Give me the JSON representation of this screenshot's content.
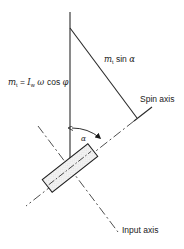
{
  "diagram": {
    "type": "gyroscope-vector-diagram",
    "labels": {
      "torque_equation": {
        "lhs_symbol": "m",
        "lhs_sub": "t",
        "equals": " = ",
        "inertia_symbol": "I",
        "inertia_sub": "w",
        "omega": " ω ",
        "cos": "cos ",
        "phi": "φ"
      },
      "component": {
        "symbol": "m",
        "sub": "t",
        "func": " sin ",
        "angle": "α"
      },
      "spin_axis": "Spin axis",
      "input_axis": "Input axis",
      "angle_label": "α"
    },
    "colors": {
      "line": "#2a2a2a",
      "dash": "#3a3a3a",
      "box_fill": "#f2f2f2",
      "stipple": "#9a9a9a",
      "background": "#ffffff"
    }
  }
}
